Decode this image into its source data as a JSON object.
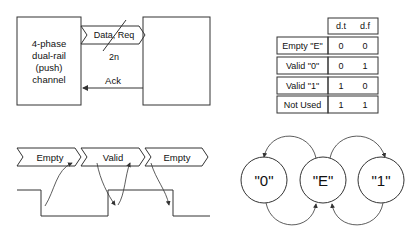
{
  "channel_diagram": {
    "sender_label_lines": [
      "4-phase",
      "dual-rail",
      "(push)",
      "channel"
    ],
    "data_bus_label": "Data, Req",
    "bus_width_label": "2n",
    "ack_label": "Ack"
  },
  "encoding_table": {
    "columns": [
      "d.t",
      "d.f"
    ],
    "rows": [
      {
        "label": "Empty \"E\"",
        "dt": "0",
        "df": "0"
      },
      {
        "label": "Valid \"0\"",
        "dt": "0",
        "df": "1"
      },
      {
        "label": "Valid \"1\"",
        "dt": "1",
        "df": "0"
      },
      {
        "label": "Not Used",
        "dt": "1",
        "df": "1"
      }
    ]
  },
  "timing_diagram": {
    "phases": [
      "Empty",
      "Valid",
      "Empty"
    ]
  },
  "state_diagram": {
    "states": [
      "\"0\"",
      "\"E\"",
      "\"1\""
    ]
  },
  "colors": {
    "stroke": "#333333",
    "text": "#111111",
    "background": "#ffffff"
  }
}
